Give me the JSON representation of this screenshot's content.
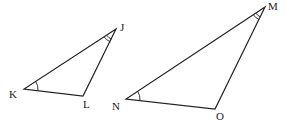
{
  "diagram": {
    "triangles": [
      {
        "name": "JKL",
        "vertices": {
          "J": {
            "label": "J",
            "x": 116,
            "y": 29,
            "label_x": 120,
            "label_y": 31
          },
          "K": {
            "label": "K",
            "x": 24,
            "y": 89,
            "label_x": 9,
            "label_y": 98
          },
          "L": {
            "label": "L",
            "x": 83,
            "y": 96,
            "label_x": 83,
            "label_y": 108
          }
        },
        "angle_marks": [
          {
            "vertex": "K",
            "arcs": 1
          },
          {
            "vertex": "J",
            "arcs": 2
          }
        ]
      },
      {
        "name": "MNO",
        "vertices": {
          "M": {
            "label": "M",
            "x": 265,
            "y": 7,
            "label_x": 268,
            "label_y": 10
          },
          "N": {
            "label": "N",
            "x": 126,
            "y": 99,
            "label_x": 112,
            "label_y": 110
          },
          "O": {
            "label": "O",
            "x": 215,
            "y": 109,
            "label_x": 216,
            "label_y": 120
          }
        },
        "angle_marks": [
          {
            "vertex": "N",
            "arcs": 1
          },
          {
            "vertex": "M",
            "arcs": 2
          }
        ]
      }
    ]
  }
}
